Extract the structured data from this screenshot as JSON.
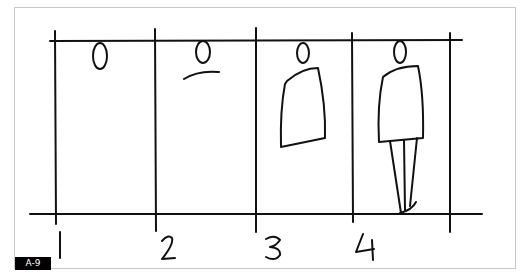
{
  "figure": {
    "label": "A-9",
    "panels": [
      {
        "number": "1",
        "description": "head only"
      },
      {
        "number": "2",
        "description": "head and shoulders"
      },
      {
        "number": "3",
        "description": "head and torso"
      },
      {
        "number": "4",
        "description": "full figure with legs"
      }
    ],
    "colors": {
      "ink": "#111111",
      "frame": "#c8c8c8",
      "badge_bg": "#000000",
      "badge_text": "#ffffff"
    }
  }
}
